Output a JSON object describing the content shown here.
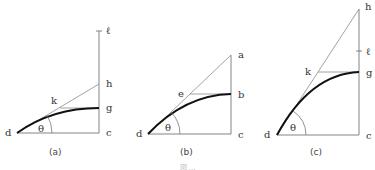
{
  "figure": {
    "panels": [
      {
        "id": "a",
        "caption": "(a)",
        "labels": {
          "d": "d",
          "c": "c",
          "g": "g",
          "h": "h",
          "k": "k",
          "ell": "ℓ",
          "theta": "θ"
        }
      },
      {
        "id": "b",
        "caption": "(b)",
        "labels": {
          "d": "d",
          "c": "c",
          "b": "b",
          "a": "a",
          "e": "e",
          "theta": "θ"
        }
      },
      {
        "id": "c",
        "caption": "(c)",
        "labels": {
          "d": "d",
          "c": "c",
          "g": "g",
          "h": "h",
          "k": "k",
          "ell": "ℓ",
          "theta": "θ"
        }
      }
    ],
    "caption_text": "図 ..."
  }
}
